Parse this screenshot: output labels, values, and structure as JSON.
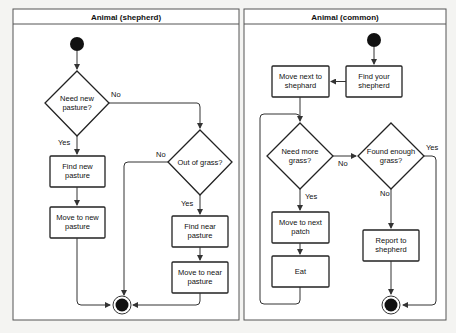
{
  "lanes": [
    {
      "title": "Animal (shepherd)",
      "decisions": [
        {
          "id": "need-new-pasture",
          "line1": "Need new",
          "line2": "pasture?"
        },
        {
          "id": "out-of-grass",
          "line1": "Out of grass?",
          "line2": ""
        }
      ],
      "actions": [
        {
          "id": "find-new-pasture",
          "line1": "Find new",
          "line2": "pasture"
        },
        {
          "id": "move-to-new-pasture",
          "line1": "Move to new",
          "line2": "pasture"
        },
        {
          "id": "find-near-pasture",
          "line1": "Find near",
          "line2": "pasture"
        },
        {
          "id": "move-to-near-pasture",
          "line1": "Move to near",
          "line2": "pasture"
        }
      ],
      "edge_labels": {
        "need_no": "No",
        "need_yes": "Yes",
        "grass_no": "No",
        "grass_yes": "Yes"
      }
    },
    {
      "title": "Animal (common)",
      "decisions": [
        {
          "id": "need-more-grass",
          "line1": "Need more",
          "line2": "grass?"
        },
        {
          "id": "found-enough-grass",
          "line1": "Found enough",
          "line2": "grass?"
        }
      ],
      "actions": [
        {
          "id": "find-your-shepherd",
          "line1": "Find your",
          "line2": "shepherd"
        },
        {
          "id": "move-next-to-shephard",
          "line1": "Move next to",
          "line2": "shephard"
        },
        {
          "id": "move-to-next-patch",
          "line1": "Move to next",
          "line2": "patch"
        },
        {
          "id": "eat",
          "line1": "Eat",
          "line2": ""
        },
        {
          "id": "report-to-shepherd",
          "line1": "Report to",
          "line2": "shepherd"
        }
      ],
      "edge_labels": {
        "more_no": "No",
        "more_yes": "Yes",
        "found_yes": "Yes",
        "found_no": "No"
      }
    }
  ]
}
